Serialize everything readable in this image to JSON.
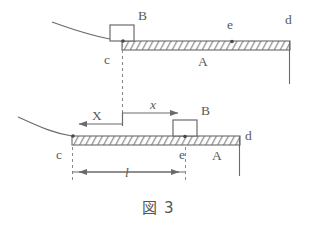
{
  "figure": {
    "caption": "図 3",
    "caption_label": "figure-3",
    "colors": {
      "line": "#6b6b6b",
      "hatch": "#707070",
      "text": "#5a5a5a",
      "background": "#ffffff"
    },
    "panels": [
      {
        "id": "upper",
        "name": "initial-configuration",
        "labels": {
          "block": "B",
          "beam": "A",
          "left_end": "c",
          "right_end": "d",
          "point_e": "e"
        },
        "block_position": "at-left-end-c",
        "beam_start_x": 122,
        "beam_end_x": 290,
        "beam_top_y": 41,
        "beam_thickness": 9
      },
      {
        "id": "lower",
        "name": "displaced-configuration",
        "labels": {
          "block": "B",
          "beam": "A",
          "left_end": "c",
          "right_end": "d",
          "point_e": "e",
          "displacement_beam": "X",
          "displacement_block": "x",
          "length": "l"
        },
        "block_position": "at-point-e",
        "beam_start_x": 72,
        "beam_end_x": 240,
        "beam_top_y": 136,
        "beam_thickness": 9
      }
    ],
    "dimensions": [
      {
        "name": "beam-displacement-X",
        "symbol": "X",
        "direction": "left",
        "from_x": 122,
        "to_x": 72,
        "y": 124
      },
      {
        "name": "block-displacement-x",
        "symbol": "x",
        "direction": "right",
        "from_x": 122,
        "to_x": 185,
        "y": 113
      },
      {
        "name": "length-l",
        "symbol": "l",
        "direction": "both",
        "from_x": 72,
        "to_x": 185,
        "y": 172
      }
    ]
  }
}
